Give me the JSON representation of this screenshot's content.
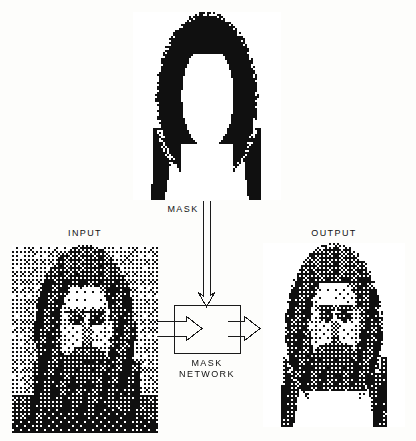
{
  "figure": {
    "background_color": "#fdfdfb",
    "ink_color": "#1a1a1a",
    "frame_color": "#777777"
  },
  "labels": {
    "mask": "MASK",
    "input": "INPUT",
    "output": "OUTPUT",
    "network_line1": "MASK",
    "network_line2": "NETWORK"
  },
  "panels": {
    "mask": {
      "caption": "MASK",
      "x": 133,
      "y": 12,
      "w": 148,
      "h": 188,
      "kind": "binary-mask",
      "description": "black silhouette of long hair with face-shaped hole"
    },
    "input": {
      "caption": "INPUT",
      "x": 12,
      "y": 245,
      "w": 146,
      "h": 188,
      "kind": "halftone-photo",
      "description": "dithered grayscale portrait, head and shoulders with long hair on textured background"
    },
    "output": {
      "caption": "OUTPUT",
      "x": 263,
      "y": 243,
      "w": 142,
      "h": 184,
      "kind": "halftone-photo-masked",
      "description": "dithered grayscale portrait with background removed by the mask"
    }
  },
  "network_block": {
    "label_line1": "MASK",
    "label_line2": "NETWORK",
    "x": 174,
    "y": 305,
    "w": 66,
    "h": 48
  },
  "arrows": [
    {
      "name": "mask-to-network",
      "direction": "down",
      "style": "open-outline",
      "from": "mask-panel",
      "to": "network-block"
    },
    {
      "name": "input-to-network",
      "direction": "right",
      "style": "open-outline",
      "from": "input-panel",
      "to": "network-block"
    },
    {
      "name": "network-to-output",
      "direction": "right",
      "style": "open-outline",
      "from": "network-block",
      "to": "output-panel"
    }
  ],
  "chart_data": {
    "type": "diagram",
    "nodes": [
      {
        "id": "mask",
        "label": "MASK",
        "role": "input-mask"
      },
      {
        "id": "input",
        "label": "INPUT",
        "role": "input-image"
      },
      {
        "id": "network",
        "label": "MASK NETWORK",
        "role": "process"
      },
      {
        "id": "output",
        "label": "OUTPUT",
        "role": "result-image"
      }
    ],
    "edges": [
      {
        "from": "mask",
        "to": "network"
      },
      {
        "from": "input",
        "to": "network"
      },
      {
        "from": "network",
        "to": "output"
      }
    ]
  }
}
